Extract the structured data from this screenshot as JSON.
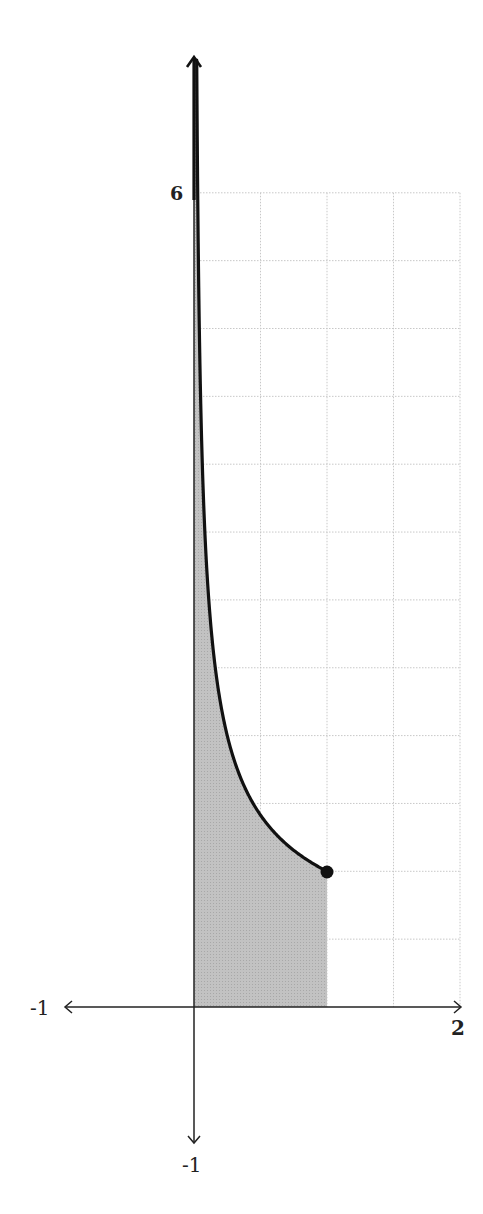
{
  "chart_data": {
    "type": "area",
    "title": "",
    "xlabel": "",
    "ylabel": "",
    "function": "y = 1/sqrt(x)",
    "shaded_region": {
      "x_from": 0,
      "x_to": 1,
      "description": "area under curve from x=0 to x=1"
    },
    "x": [
      0.02,
      0.05,
      0.1,
      0.25,
      0.5,
      0.75,
      1.0
    ],
    "series": [
      {
        "name": "y = 1/sqrt(x)",
        "values": [
          7.07,
          4.47,
          3.16,
          2.0,
          1.41,
          1.15,
          1.0
        ]
      }
    ],
    "endpoint": {
      "x": 1,
      "y": 1,
      "marker": "filled-circle"
    },
    "xlim": [
      -1,
      2
    ],
    "ylim": [
      -1,
      6
    ],
    "grid": {
      "on": true,
      "x_step": 0.5,
      "y_step": 0.5,
      "x_range": [
        0,
        2
      ],
      "y_range": [
        0,
        6
      ],
      "style": "dotted"
    },
    "tick_labels": {
      "x_left": "-1",
      "x_right": "2",
      "y_top": "6",
      "y_bottom": "-1"
    },
    "legend": null
  },
  "labels": {
    "x_min": "-1",
    "x_max": "2",
    "y_max": "6",
    "y_min": "-1"
  },
  "colors": {
    "curve": "#111111",
    "fill": "#b8b8b8",
    "grid": "#c8c8c8",
    "axis": "#222222"
  }
}
